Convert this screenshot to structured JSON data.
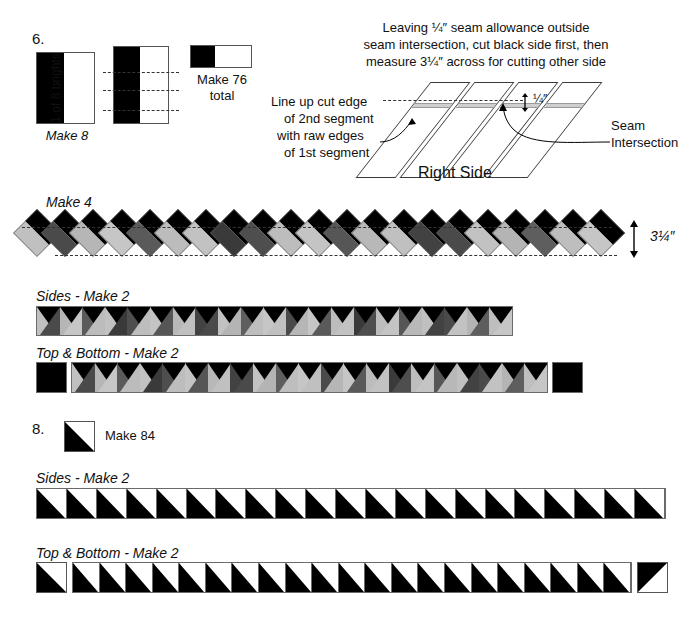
{
  "steps": {
    "six": {
      "number": "6.",
      "strip_label_vertical": "1 of 8 brights",
      "make_8": "Make 8",
      "make_76": "Make 76",
      "make_76_second_line": "total"
    },
    "eight": {
      "number": "8.",
      "make_84": "Make 84"
    }
  },
  "instructions": {
    "line1": "Leaving ¼″ seam allowance outside",
    "line2": "seam intersection, cut black side first, then",
    "line3": "measure 3¼″ across for cutting other side",
    "callout_left_line1": "Line up cut edge",
    "callout_left_line2": "of 2nd segment",
    "callout_left_line3": "with raw edges",
    "callout_left_line4": "of 1st segment",
    "callout_right_line1": "Seam",
    "callout_right_line2": "Intersection",
    "right_side": "Right Side",
    "quarter_inch": "¼″"
  },
  "strips": {
    "make_4": "Make 4",
    "measure_314": "3¼″",
    "sides_make_2": "Sides - Make 2",
    "top_bottom_make_2": "Top & Bottom - Make 2",
    "sides_make_2_hst": "Sides - Make 2",
    "top_bottom_make_2_hst": "Top & Bottom - Make 2"
  },
  "colors": {
    "black": "#000000",
    "dark_gray": "#3f3f3f",
    "mid_gray": "#555555",
    "light_gray": "#b4b4b4",
    "pale_gray": "#c8c8c8",
    "outline": "#6a6a6a",
    "background": "#ffffff"
  },
  "chart_data": {
    "type": "table",
    "diamond_strip": {
      "count": 21,
      "top_half_color": "#000000",
      "bottom_half_sequence": [
        "#c0c0c0",
        "#4a4a4a",
        "#b6b6b6",
        "#c6c6c6",
        "#5a5a5a",
        "#bcbcbc",
        "#c2c2c2",
        "#3a3a3a",
        "#4e4e4e",
        "#bdbdbd",
        "#c4c4c4",
        "#565656",
        "#b8b8b8",
        "#c0c0c0",
        "#424242",
        "#4a4a4a",
        "#c2c2c2",
        "#b4b4b4",
        "#5e5e5e",
        "#bebebe",
        "#c6c6c6"
      ]
    },
    "sides_band": {
      "count": 21,
      "note": "diamond strip trimmed to a straight band"
    },
    "top_bottom_band": {
      "count": 21,
      "end_blocks": 2,
      "end_block_color": "#000000"
    },
    "hst_sides_band": {
      "count": 21
    },
    "hst_top_bottom_band": {
      "count": 21,
      "separate_units": 2
    }
  }
}
